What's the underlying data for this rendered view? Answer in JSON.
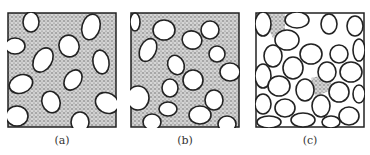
{
  "figure": {
    "panels": [
      {
        "id": "a",
        "label": "(a)",
        "description": "Sparse grains dispersed in dense stippled matrix"
      },
      {
        "id": "b",
        "label": "(b)",
        "description": "Grains beginning to contact in stippled matrix"
      },
      {
        "id": "c",
        "label": "(c)",
        "description": "Grain-supported packing with little matrix"
      }
    ],
    "colors": {
      "matrix": "#9a9a9a",
      "grain_fill": "#ffffff",
      "outline": "#222222"
    }
  }
}
